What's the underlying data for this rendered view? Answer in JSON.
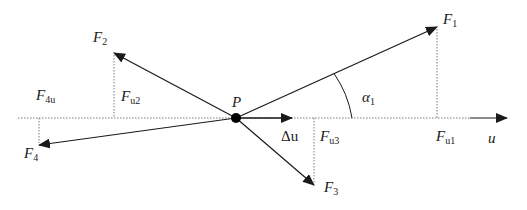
{
  "diagram": {
    "point": {
      "label": "P",
      "x": 236,
      "y": 118
    },
    "axis": {
      "label": "u",
      "x_start": 18,
      "x_end": 507,
      "y": 118
    },
    "displacement": {
      "label": "Δu",
      "x_end": 292
    },
    "angle": {
      "label": "α",
      "sub": "1"
    },
    "forces": [
      {
        "name": "F1",
        "label": "F",
        "sub": "1",
        "tip_x": 437,
        "tip_y": 27,
        "proj_label": "F",
        "proj_sub": "u1"
      },
      {
        "name": "F2",
        "label": "F",
        "sub": "2",
        "tip_x": 114,
        "tip_y": 53,
        "proj_label": "F",
        "proj_sub": "u2"
      },
      {
        "name": "F3",
        "label": "F",
        "sub": "3",
        "tip_x": 314,
        "tip_y": 185,
        "proj_label": "F",
        "proj_sub": "u3"
      },
      {
        "name": "F4",
        "label": "F",
        "sub": "4",
        "tip_x": 39,
        "tip_y": 145,
        "proj_label": "F",
        "proj_sub": "4u"
      }
    ],
    "colors": {
      "line": "#1a1a1a",
      "dotted": "#7a7a7a"
    }
  }
}
